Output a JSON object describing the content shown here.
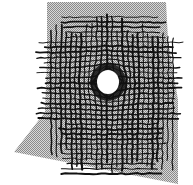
{
  "image": {
    "description": "Hand-drawn dense crosshatched grid of dark lines on a halftone gray sheet with a white circular hole at the center",
    "background": "#ffffff",
    "sheet": {
      "color": "#a8a8a8",
      "polygon": [
        [
          47,
          2
        ],
        [
          166,
          2
        ],
        [
          168,
          40
        ],
        [
          178,
          100
        ],
        [
          178,
          184
        ],
        [
          14,
          152
        ],
        [
          45,
          112
        ],
        [
          47,
          60
        ]
      ]
    },
    "hole": {
      "cx": 108,
      "cy": 82,
      "rx": 11,
      "ry": 12,
      "color": "#ffffff"
    },
    "ink_color": "#111111",
    "grid": {
      "x_start": 52,
      "x_end": 172,
      "x_step": 5,
      "y_start": 14,
      "y_end": 175,
      "y_step": 5
    }
  }
}
